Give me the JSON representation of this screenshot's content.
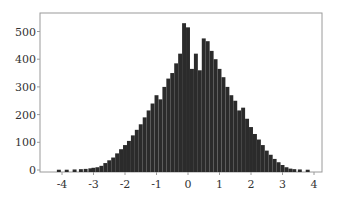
{
  "chart_data": {
    "type": "bar",
    "title": "",
    "xlabel": "",
    "ylabel": "",
    "xlim": [
      -4.5,
      4.3
    ],
    "ylim": [
      0,
      560
    ],
    "grid": false,
    "legend": null,
    "bin_width": 0.125,
    "bar_color": "#2b2b2b",
    "x_ticks": [
      -4,
      -3,
      -2,
      -1,
      0,
      1,
      2,
      3,
      4
    ],
    "x_tick_labels": [
      "-4",
      "-3",
      "-2",
      "-1",
      "0",
      "1",
      "2",
      "3",
      "4"
    ],
    "y_ticks": [
      0,
      100,
      200,
      300,
      400,
      500
    ],
    "y_tick_labels": [
      "0",
      "100",
      "200",
      "300",
      "400",
      "500"
    ],
    "bins": [
      {
        "x": -4.1,
        "count": 1
      },
      {
        "x": -3.85,
        "count": 1
      },
      {
        "x": -3.6,
        "count": 2
      },
      {
        "x": -3.4,
        "count": 3
      },
      {
        "x": -3.25,
        "count": 4
      },
      {
        "x": -3.1,
        "count": 6
      },
      {
        "x": -3.0,
        "count": 8
      },
      {
        "x": -2.875,
        "count": 10
      },
      {
        "x": -2.75,
        "count": 15
      },
      {
        "x": -2.625,
        "count": 25
      },
      {
        "x": -2.5,
        "count": 35
      },
      {
        "x": -2.375,
        "count": 45
      },
      {
        "x": -2.25,
        "count": 60
      },
      {
        "x": -2.125,
        "count": 75
      },
      {
        "x": -2.0,
        "count": 90
      },
      {
        "x": -1.875,
        "count": 105
      },
      {
        "x": -1.75,
        "count": 125
      },
      {
        "x": -1.625,
        "count": 145
      },
      {
        "x": -1.5,
        "count": 165
      },
      {
        "x": -1.375,
        "count": 190
      },
      {
        "x": -1.25,
        "count": 215
      },
      {
        "x": -1.125,
        "count": 240
      },
      {
        "x": -1.0,
        "count": 270
      },
      {
        "x": -0.875,
        "count": 255
      },
      {
        "x": -0.75,
        "count": 300
      },
      {
        "x": -0.625,
        "count": 330
      },
      {
        "x": -0.5,
        "count": 350
      },
      {
        "x": -0.375,
        "count": 385
      },
      {
        "x": -0.25,
        "count": 420
      },
      {
        "x": -0.125,
        "count": 530
      },
      {
        "x": 0.0,
        "count": 515
      },
      {
        "x": 0.125,
        "count": 365
      },
      {
        "x": 0.25,
        "count": 420
      },
      {
        "x": 0.375,
        "count": 360
      },
      {
        "x": 0.5,
        "count": 475
      },
      {
        "x": 0.625,
        "count": 465
      },
      {
        "x": 0.75,
        "count": 430
      },
      {
        "x": 0.875,
        "count": 400
      },
      {
        "x": 1.0,
        "count": 365
      },
      {
        "x": 1.125,
        "count": 335
      },
      {
        "x": 1.25,
        "count": 300
      },
      {
        "x": 1.375,
        "count": 270
      },
      {
        "x": 1.5,
        "count": 250
      },
      {
        "x": 1.625,
        "count": 215
      },
      {
        "x": 1.75,
        "count": 225
      },
      {
        "x": 1.875,
        "count": 185
      },
      {
        "x": 2.0,
        "count": 155
      },
      {
        "x": 2.125,
        "count": 130
      },
      {
        "x": 2.25,
        "count": 110
      },
      {
        "x": 2.375,
        "count": 90
      },
      {
        "x": 2.5,
        "count": 70
      },
      {
        "x": 2.625,
        "count": 55
      },
      {
        "x": 2.75,
        "count": 40
      },
      {
        "x": 2.875,
        "count": 28
      },
      {
        "x": 3.0,
        "count": 18
      },
      {
        "x": 3.125,
        "count": 10
      },
      {
        "x": 3.25,
        "count": 5
      },
      {
        "x": 3.375,
        "count": 3
      },
      {
        "x": 3.55,
        "count": 2
      },
      {
        "x": 3.8,
        "count": 1
      }
    ]
  },
  "layout": {
    "plot_left": 40,
    "plot_right": 322,
    "plot_top": 13,
    "plot_bottom": 172,
    "x_zero_px": 188,
    "x_px_per_unit": 31.5,
    "y_zero_px": 170,
    "y_px_per_count": 0.277
  }
}
